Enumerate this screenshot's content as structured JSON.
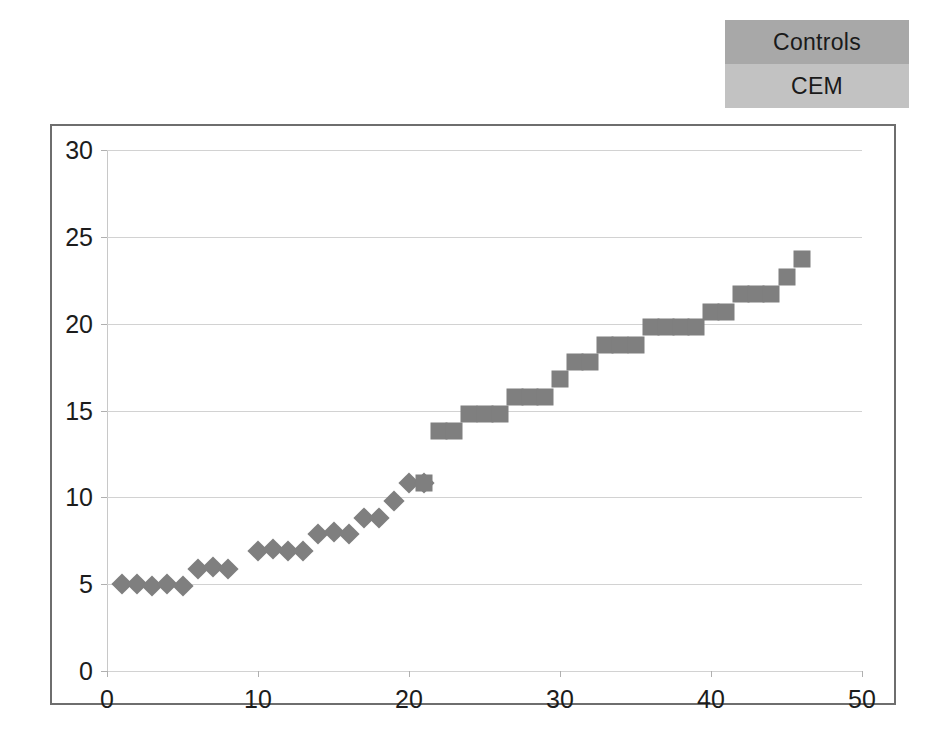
{
  "legend": {
    "position": "top-right",
    "entries": [
      {
        "label": "Controls",
        "color": "#a8a8a8",
        "marker": "diamond"
      },
      {
        "label": "CEM",
        "color": "#c2c2c2",
        "marker": "square"
      }
    ]
  },
  "chart_data": {
    "type": "scatter",
    "title": "",
    "subtitle": "",
    "xlabel": "",
    "ylabel": "",
    "xlim": [
      0,
      50
    ],
    "ylim": [
      0,
      30
    ],
    "xticks": [
      0,
      10,
      20,
      30,
      40,
      50
    ],
    "yticks": [
      0,
      5,
      10,
      15,
      20,
      25,
      30
    ],
    "grid": "horizontal",
    "marker_color": "#7f7f7f",
    "annotations": [],
    "series": [
      {
        "name": "Controls",
        "marker": "diamond",
        "points": [
          [
            1,
            5.0
          ],
          [
            2,
            5.0
          ],
          [
            3,
            4.9
          ],
          [
            4,
            5.0
          ],
          [
            5,
            4.9
          ],
          [
            6,
            5.9
          ],
          [
            7,
            6.0
          ],
          [
            8,
            5.9
          ],
          [
            10,
            6.9
          ],
          [
            11,
            7.0
          ],
          [
            12,
            6.9
          ],
          [
            13,
            6.9
          ],
          [
            14,
            7.9
          ],
          [
            15,
            8.0
          ],
          [
            16,
            7.9
          ],
          [
            17,
            8.8
          ],
          [
            18,
            8.8
          ],
          [
            19,
            9.8
          ],
          [
            20,
            10.8
          ],
          [
            21,
            10.8
          ]
        ]
      },
      {
        "name": "CEM",
        "marker": "square",
        "points": [
          [
            21,
            10.8
          ],
          [
            22,
            13.8
          ],
          [
            23,
            13.8
          ],
          [
            24,
            14.8
          ],
          [
            25,
            14.8
          ],
          [
            26,
            14.8
          ],
          [
            27,
            15.8
          ],
          [
            28,
            15.8
          ],
          [
            29,
            15.8
          ],
          [
            30,
            16.8
          ],
          [
            31,
            17.8
          ],
          [
            32,
            17.8
          ],
          [
            33,
            18.8
          ],
          [
            34,
            18.8
          ],
          [
            35,
            18.8
          ],
          [
            36,
            19.8
          ],
          [
            37,
            19.8
          ],
          [
            38,
            19.8
          ],
          [
            39,
            19.8
          ],
          [
            40,
            20.7
          ],
          [
            41,
            20.7
          ],
          [
            42,
            21.7
          ],
          [
            43,
            21.7
          ],
          [
            44,
            21.7
          ],
          [
            45,
            22.7
          ],
          [
            46,
            23.7
          ]
        ]
      }
    ]
  }
}
